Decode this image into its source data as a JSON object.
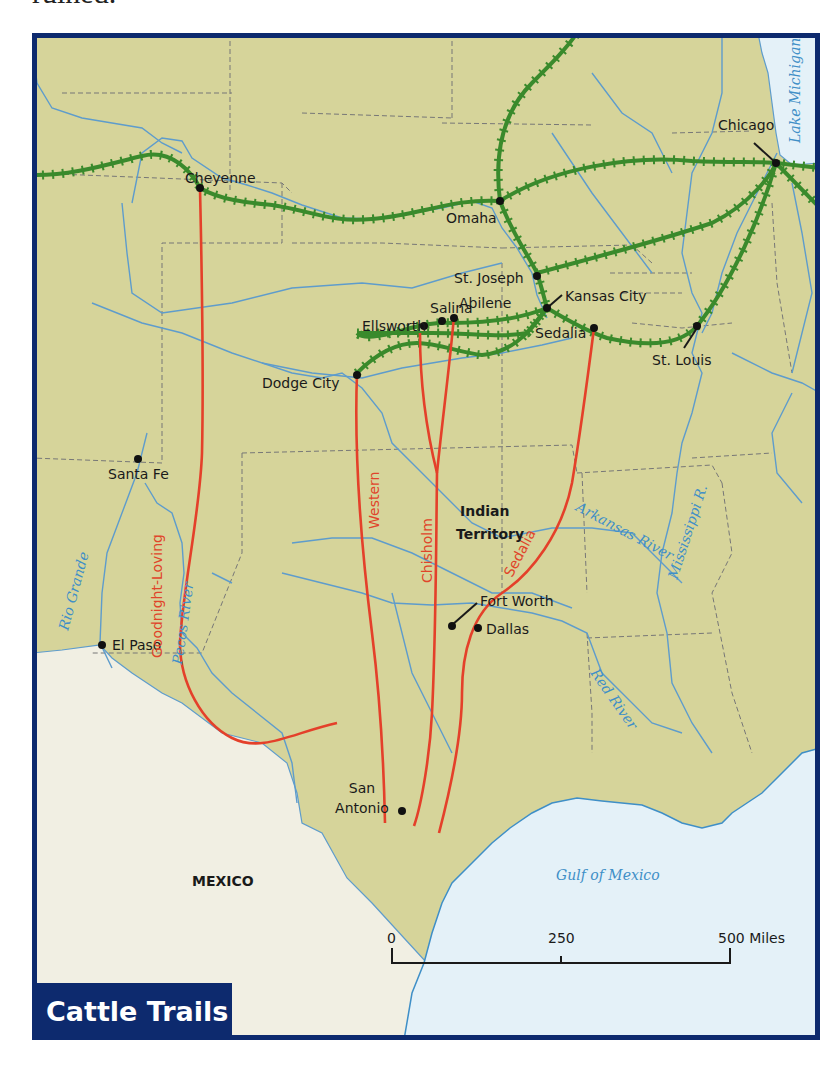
{
  "page": {
    "top_text_fragment": "ruined."
  },
  "map": {
    "title": "Cattle Trails",
    "colors": {
      "land": "#d6d49a",
      "mexico": "#f1efe3",
      "water": "#e4f1f8",
      "river": "#5e9ccc",
      "border": "#0d2a6e",
      "trail": "#e4402a",
      "railroad": "#3a8a2c",
      "state_line": "#777777"
    },
    "cities": [
      {
        "name": "Chicago"
      },
      {
        "name": "Cheyenne"
      },
      {
        "name": "Omaha"
      },
      {
        "name": "St. Joseph"
      },
      {
        "name": "Kansas City"
      },
      {
        "name": "Salina"
      },
      {
        "name": "Abilene"
      },
      {
        "name": "Ellsworth"
      },
      {
        "name": "Sedalia"
      },
      {
        "name": "St. Louis"
      },
      {
        "name": "Dodge City"
      },
      {
        "name": "Santa Fe"
      },
      {
        "name": "Fort Worth"
      },
      {
        "name": "Dallas"
      },
      {
        "name": "El Paso"
      },
      {
        "name": "San Antonio"
      }
    ],
    "trails": [
      {
        "name": "Goodnight-Loving"
      },
      {
        "name": "Western"
      },
      {
        "name": "Chisholm"
      },
      {
        "name": "Sedalia"
      }
    ],
    "water_labels": [
      {
        "name": "Lake Michigan"
      },
      {
        "name": "Rio Grande"
      },
      {
        "name": "Pecos River"
      },
      {
        "name": "Arkansas River"
      },
      {
        "name": "Mississippi R."
      },
      {
        "name": "Red River"
      },
      {
        "name": "Gulf of Mexico"
      }
    ],
    "region_labels": [
      {
        "name": "Indian"
      },
      {
        "name": "Territory"
      },
      {
        "name": "MEXICO"
      }
    ],
    "scale_bar": {
      "ticks": [
        "0",
        "250",
        "500 Miles"
      ]
    }
  }
}
